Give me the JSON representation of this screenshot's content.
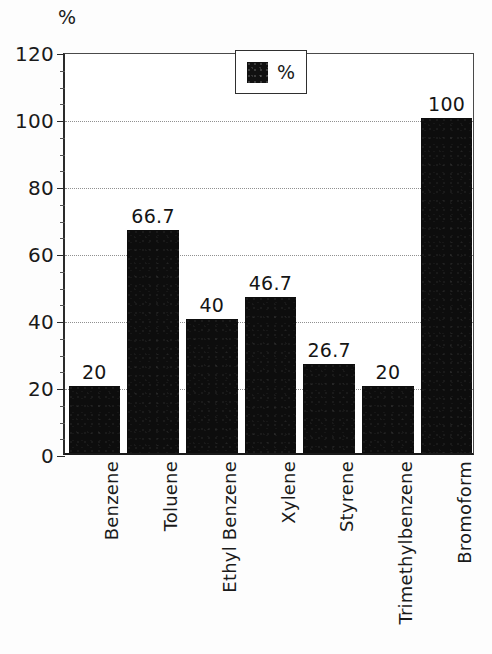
{
  "chart_data": {
    "type": "bar",
    "title": "",
    "xlabel": "",
    "ylabel": "%",
    "ylim": [
      0,
      120
    ],
    "ytick_step": 20,
    "yminor_step": 5,
    "grid": true,
    "grid_style": "dotted-horizontal",
    "legend_position": "top-center-inside",
    "categories": [
      "Benzene",
      "Toluene",
      "Ethyl Benzene",
      "Xylene",
      "Styrene",
      "Trimethylbenzene",
      "Bromoform"
    ],
    "values": [
      20,
      66.7,
      40,
      46.7,
      26.7,
      20,
      100
    ],
    "value_labels": [
      "20",
      "66.7",
      "40",
      "46.7",
      "26.7",
      "20",
      "100"
    ],
    "ytick_labels": [
      "0",
      "20",
      "40",
      "60",
      "80",
      "100",
      "120"
    ],
    "ytick_values": [
      0,
      20,
      40,
      60,
      80,
      100,
      120
    ],
    "series": [
      {
        "name": "%",
        "color": "#0d0d0d",
        "values": [
          20,
          66.7,
          40,
          46.7,
          26.7,
          20,
          100
        ]
      }
    ],
    "legend": [
      {
        "label": "%",
        "color": "#0d0d0d"
      }
    ]
  },
  "axis_title": "%",
  "legend_label": "%"
}
